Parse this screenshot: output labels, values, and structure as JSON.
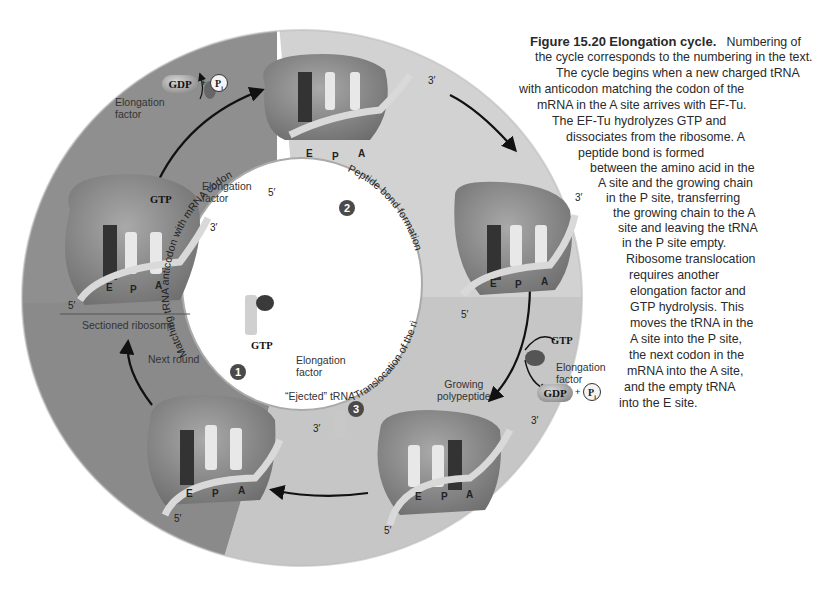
{
  "figure": {
    "number": "Figure 15.20",
    "title": "Elongation cycle.",
    "caption_lines": [
      "Numbering of",
      "the cycle corresponds to the numbering in the text.",
      "The cycle begins when a new charged tRNA",
      "with anticodon matching the codon of the",
      "mRNA in the A site arrives with EF-Tu.",
      "The EF-Tu hydrolyzes GTP and",
      "dissociates from the ribosome. A",
      "peptide bond is formed",
      "between the amino acid in the",
      "A site and the growing chain",
      "in the P site, transferring",
      "the growing chain to the A",
      "site and leaving the tRNA",
      "in the P site empty.",
      "Ribosome translocation",
      "requires another",
      "elongation factor and",
      "GTP hydrolysis. This",
      "moves the tRNA in the",
      "A site into the P site,",
      "the next codon in the",
      "mRNA into the A site,",
      "and the empty tRNA",
      "into the E site."
    ]
  },
  "cycle": {
    "quadrant_colors": {
      "top_left": "#8f8f8f",
      "top_right": "#d2d2d2",
      "bottom_right": "#c4c4c4",
      "bottom_left": "#8a8a8a"
    },
    "steps": [
      {
        "number": "1",
        "label": "Matching tRNA anticodon with mRNA codon"
      },
      {
        "number": "2",
        "label": "Peptide bond formation"
      },
      {
        "number": "3",
        "label": "Translocation of the ribosome"
      }
    ],
    "labels": {
      "elongation_factor": "Elongation factor",
      "elongation": "Elongation",
      "factor": "factor",
      "sectioned_ribosome": "Sectioned ribosome",
      "next_round": "Next round",
      "ejected_trna": "“Ejected” tRNA",
      "growing": "Growing",
      "polypeptide": "polypeptide",
      "gtp": "GTP",
      "gdp": "GDP",
      "pi": "P",
      "pi_sub": "i",
      "plus": "+"
    },
    "sites": {
      "e": "E",
      "p": "P",
      "a": "A"
    },
    "ends": {
      "five": "5′",
      "three": "3′"
    }
  }
}
